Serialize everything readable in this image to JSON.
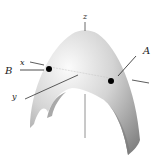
{
  "diagram": {
    "type": "3d-surface",
    "labels": {
      "z_axis": "z",
      "x_axis": "x",
      "y_axis": "y",
      "point_a": "A",
      "point_b": "B"
    },
    "colors": {
      "surface_light": "#f2f2f2",
      "surface_dark": "#8c8c8c",
      "axis": "#333333",
      "point": "#000000"
    }
  }
}
